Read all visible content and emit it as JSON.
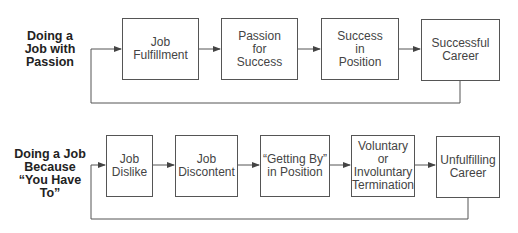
{
  "rows": [
    {
      "label": "Doing a\nJob with\nPassion",
      "steps": [
        "Job\nFulfillment",
        "Passion\nfor\nSuccess",
        "Success\nin\nPosition",
        "Successful\nCareer"
      ]
    },
    {
      "label": "Doing a Job\nBecause\n“You Have\nTo”",
      "steps": [
        "Job\nDislike",
        "Job\nDiscontent",
        "“Getting By”\nin Position",
        "Voluntary or\nInvoluntary\nTermination",
        "Unfulfilling\nCareer"
      ]
    }
  ],
  "colors": {
    "line": "#555555",
    "text": "#444444",
    "label": "#222222"
  }
}
